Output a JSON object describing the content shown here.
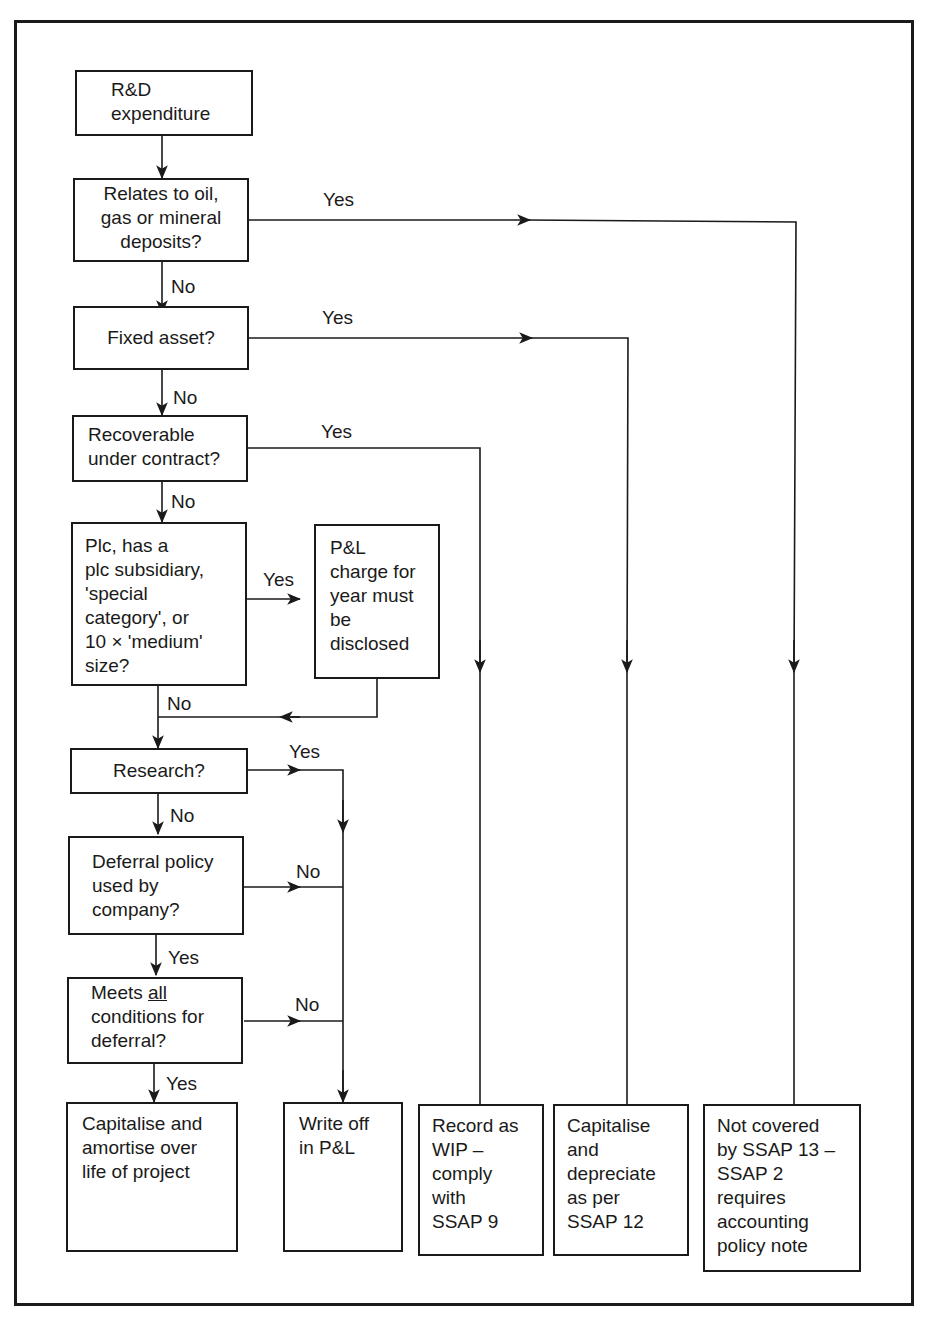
{
  "diagram": {
    "type": "flowchart",
    "nodes": {
      "start": "R&D\nexpenditure",
      "q_oil": "Relates to oil,\ngas or mineral\ndeposits?",
      "q_fixed": "Fixed asset?",
      "q_recoverable": "Recoverable\nunder contract?",
      "q_plc": "Plc, has a\nplc subsidiary,\n'special\ncategory', or\n10 × 'medium'\nsize?",
      "pl_disclose": "P&L\ncharge for\nyear must\nbe\ndisclosed",
      "q_research": "Research?",
      "q_deferral_policy": "Deferral policy\nused by\ncompany?",
      "q_meets_prefix": "Meets ",
      "q_meets_underlined": "all",
      "q_meets_suffix": "\nconditions for\ndeferral?",
      "out_capitalise_amortise": "Capitalise and\namortise over\nlife of project",
      "out_write_off": "Write off\nin P&L",
      "out_wip": "Record as\nWIP –\ncomply\nwith\nSSAP 9",
      "out_depreciate": "Capitalise\nand\ndepreciate\nas per\nSSAP 12",
      "out_not_covered": "Not covered\nby SSAP 13 –\nSSAP 2\nrequires\naccounting\npolicy note"
    },
    "edge_labels": {
      "oil_yes": "Yes",
      "oil_no": "No",
      "fixed_yes": "Yes",
      "fixed_no": "No",
      "recoverable_yes": "Yes",
      "recoverable_no": "No",
      "plc_yes": "Yes",
      "plc_no": "No",
      "research_yes": "Yes",
      "research_no": "No",
      "deferral_no": "No",
      "deferral_yes": "Yes",
      "meets_no": "No",
      "meets_yes": "Yes"
    },
    "edges": [
      {
        "from": "start",
        "to": "q_oil"
      },
      {
        "from": "q_oil",
        "to": "out_not_covered",
        "label": "Yes"
      },
      {
        "from": "q_oil",
        "to": "q_fixed",
        "label": "No"
      },
      {
        "from": "q_fixed",
        "to": "out_depreciate",
        "label": "Yes"
      },
      {
        "from": "q_fixed",
        "to": "q_recoverable",
        "label": "No"
      },
      {
        "from": "q_recoverable",
        "to": "out_wip",
        "label": "Yes"
      },
      {
        "from": "q_recoverable",
        "to": "q_plc",
        "label": "No"
      },
      {
        "from": "q_plc",
        "to": "pl_disclose",
        "label": "Yes"
      },
      {
        "from": "q_plc",
        "to": "q_research",
        "label": "No"
      },
      {
        "from": "pl_disclose",
        "to": "q_research"
      },
      {
        "from": "q_research",
        "to": "out_write_off",
        "label": "Yes"
      },
      {
        "from": "q_research",
        "to": "q_deferral_policy",
        "label": "No"
      },
      {
        "from": "q_deferral_policy",
        "to": "out_write_off",
        "label": "No"
      },
      {
        "from": "q_deferral_policy",
        "to": "q_meets",
        "label": "Yes"
      },
      {
        "from": "q_meets",
        "to": "out_write_off",
        "label": "No"
      },
      {
        "from": "q_meets",
        "to": "out_capitalise_amortise",
        "label": "Yes"
      }
    ]
  }
}
